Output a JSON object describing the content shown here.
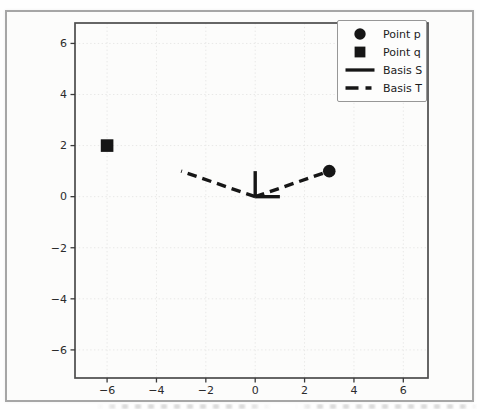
{
  "chart_data": {
    "type": "scatter",
    "title": "",
    "xlabel": "",
    "ylabel": "",
    "points": [
      {
        "label": "Point p",
        "marker": "circle",
        "x": 3,
        "y": 1
      },
      {
        "label": "Point q",
        "marker": "square",
        "x": -6,
        "y": 2
      }
    ],
    "basis_series": [
      {
        "label": "Basis S",
        "linestyle": "solid",
        "origin": [
          0,
          0
        ],
        "vectors": [
          [
            1,
            0
          ],
          [
            0,
            1
          ]
        ]
      },
      {
        "label": "Basis T",
        "linestyle": "dashed",
        "origin": [
          0,
          0
        ],
        "vectors": [
          [
            3,
            1
          ],
          [
            -3,
            1
          ]
        ]
      }
    ],
    "xticks": [
      -6,
      -4,
      -2,
      0,
      2,
      4,
      6
    ],
    "yticks": [
      -6,
      -4,
      -2,
      0,
      2,
      4,
      6
    ],
    "xlim": [
      -7.3,
      7.0
    ],
    "ylim": [
      -7.1,
      6.8
    ],
    "grid": true,
    "legend": {
      "position": "upper right",
      "entries": [
        {
          "label": "Point p",
          "swatch": "circle"
        },
        {
          "label": "Point q",
          "swatch": "square"
        },
        {
          "label": "Basis S",
          "swatch": "solid-line"
        },
        {
          "label": "Basis T",
          "swatch": "dashed-line"
        }
      ]
    },
    "colors": {
      "data": "#161616",
      "spine": "#4c4c4c",
      "tick_label": "#2b2b2b",
      "grid": "#e8e8e7",
      "frame": "#a6a6a6",
      "page": "#fcfcfb"
    }
  }
}
